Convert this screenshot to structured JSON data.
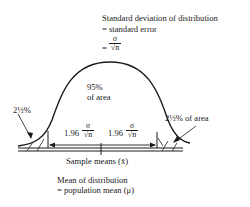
{
  "diagram": {
    "title_line1": "Standard deviation of distribution",
    "title_line2": "= standard error",
    "se_prefix": "=",
    "sigma": "σ",
    "sqrt_n": "√n",
    "center_label_line1": "95%",
    "center_label_line2": "of area",
    "left_tail_label": "2½%",
    "right_tail_label": "2½% of area",
    "left_interval_coef": "1.96",
    "right_interval_coef": "1.96",
    "x_axis_label": "Sample means (x̄)",
    "mean_label_line1": "Mean of distribution",
    "mean_label_line2": "= population mean (μ)"
  },
  "colors": {
    "ink": "#1a1a1a",
    "background": "#ffffff"
  }
}
